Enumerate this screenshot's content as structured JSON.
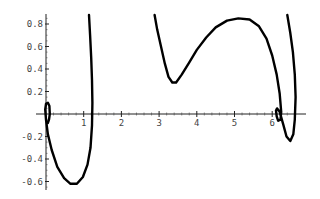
{
  "chart_data": {
    "type": "line",
    "title": "",
    "xlabel": "",
    "ylabel": "",
    "xlim": [
      -0.1,
      6.6
    ],
    "ylim": [
      -0.68,
      0.9
    ],
    "grid": false,
    "x_ticks": [
      1,
      2,
      3,
      4,
      5,
      6
    ],
    "x_tick_labels": [
      "1",
      "2",
      "3",
      "4",
      "5",
      "6"
    ],
    "y_ticks": [
      -0.6,
      -0.4,
      -0.2,
      0.2,
      0.4,
      0.6,
      0.8
    ],
    "y_tick_labels": [
      "-0.6",
      "-0.4",
      "-0.2",
      "0.2",
      "0.4",
      "0.6",
      "0.8"
    ],
    "series": [
      {
        "name": "curve-left",
        "points": [
          [
            1.14,
            0.88
          ],
          [
            1.17,
            0.7
          ],
          [
            1.2,
            0.5
          ],
          [
            1.22,
            0.3
          ],
          [
            1.23,
            0.1
          ],
          [
            1.22,
            -0.1
          ],
          [
            1.18,
            -0.3
          ],
          [
            1.1,
            -0.45
          ],
          [
            0.98,
            -0.56
          ],
          [
            0.82,
            -0.62
          ],
          [
            0.65,
            -0.62
          ],
          [
            0.48,
            -0.57
          ],
          [
            0.3,
            -0.47
          ],
          [
            0.15,
            -0.32
          ],
          [
            0.05,
            -0.18
          ],
          [
            0.0,
            -0.05
          ],
          [
            -0.02,
            0.04
          ],
          [
            0.0,
            0.09
          ],
          [
            0.05,
            0.1
          ],
          [
            0.09,
            0.07
          ],
          [
            0.1,
            0.0
          ],
          [
            0.08,
            -0.05
          ],
          [
            0.05,
            -0.08
          ]
        ]
      },
      {
        "name": "curve-right",
        "points": [
          [
            2.88,
            0.88
          ],
          [
            2.95,
            0.75
          ],
          [
            3.05,
            0.6
          ],
          [
            3.15,
            0.45
          ],
          [
            3.25,
            0.33
          ],
          [
            3.35,
            0.28
          ],
          [
            3.45,
            0.28
          ],
          [
            3.6,
            0.35
          ],
          [
            3.8,
            0.46
          ],
          [
            4.0,
            0.57
          ],
          [
            4.25,
            0.68
          ],
          [
            4.5,
            0.77
          ],
          [
            4.8,
            0.83
          ],
          [
            5.1,
            0.85
          ],
          [
            5.4,
            0.84
          ],
          [
            5.65,
            0.78
          ],
          [
            5.85,
            0.67
          ],
          [
            6.0,
            0.52
          ],
          [
            6.12,
            0.35
          ],
          [
            6.2,
            0.18
          ],
          [
            6.24,
            0.02
          ],
          [
            6.22,
            -0.05
          ],
          [
            6.16,
            -0.06
          ],
          [
            6.12,
            -0.02
          ],
          [
            6.1,
            0.03
          ],
          [
            6.13,
            0.05
          ],
          [
            6.2,
            0.02
          ],
          [
            6.3,
            -0.1
          ],
          [
            6.38,
            -0.2
          ],
          [
            6.48,
            -0.24
          ],
          [
            6.56,
            -0.18
          ],
          [
            6.6,
            -0.05
          ],
          [
            6.62,
            0.15
          ],
          [
            6.6,
            0.35
          ],
          [
            6.55,
            0.55
          ],
          [
            6.48,
            0.72
          ],
          [
            6.4,
            0.88
          ]
        ]
      }
    ]
  }
}
